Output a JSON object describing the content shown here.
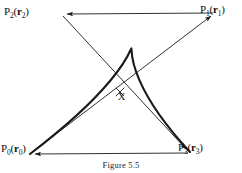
{
  "figure": {
    "caption": "Figure 5.5",
    "intersection_marker": "X",
    "stroke_color": "#1a1a1a",
    "background_color": "#ffffff",
    "control_points": [
      {
        "id": "P0",
        "name": "P",
        "index": "0",
        "vector": "r",
        "vector_index": "0",
        "x": 30,
        "y": 154
      },
      {
        "id": "P1",
        "name": "P",
        "index": "1",
        "vector": "r",
        "vector_index": "1",
        "x": 215,
        "y": 13
      },
      {
        "id": "P2",
        "name": "P",
        "index": "2",
        "vector": "r",
        "vector_index": "2",
        "x": 62,
        "y": 14
      },
      {
        "id": "P3",
        "name": "P",
        "index": "3",
        "vector": "r",
        "vector_index": "3",
        "x": 190,
        "y": 152
      }
    ]
  },
  "chart_data": {
    "type": "line",
    "title": "Figure 5.5",
    "xlabel": "",
    "ylabel": "",
    "series": [
      {
        "name": "control-polygon",
        "kind": "polyline-with-arrows",
        "points": [
          [
            30,
            154
          ],
          [
            215,
            13
          ],
          [
            62,
            14
          ],
          [
            190,
            152
          ],
          [
            30,
            154
          ]
        ]
      },
      {
        "name": "bezier-curve",
        "kind": "cubic-bezier",
        "control_points": [
          [
            30,
            154
          ],
          [
            215,
            13
          ],
          [
            62,
            14
          ],
          [
            190,
            152
          ]
        ]
      }
    ],
    "annotations": [
      {
        "text": "X",
        "x": 120,
        "y": 97
      }
    ],
    "grid": false,
    "legend": "none"
  }
}
